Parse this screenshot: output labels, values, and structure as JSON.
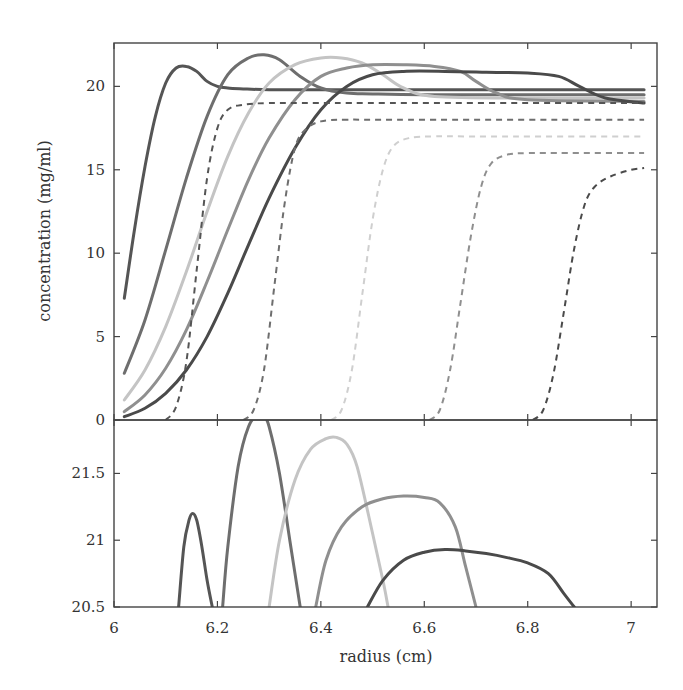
{
  "chart_data": [
    {
      "panel": "top",
      "type": "line",
      "title": "",
      "xlabel": "",
      "ylabel": "concentration (mg/ml)",
      "xlim": [
        6.0,
        7.05
      ],
      "ylim": [
        0,
        22.6
      ],
      "xticks": [
        6,
        6.2,
        6.4,
        6.6,
        6.8,
        7
      ],
      "xtick_labels": [],
      "yticks": [
        0,
        5,
        10,
        15,
        20
      ],
      "ytick_labels": [
        "0",
        "5",
        "10",
        "15",
        "20"
      ],
      "grid": false,
      "legend": null,
      "series": [
        {
          "name": "solid-1",
          "style": "solid",
          "color": "#555555",
          "x": [
            6.02,
            6.04,
            6.06,
            6.08,
            6.1,
            6.12,
            6.14,
            6.16,
            6.18,
            6.2,
            6.22,
            6.25,
            6.3,
            6.4,
            6.6,
            6.8,
            7.025
          ],
          "y": [
            7.3,
            11.5,
            15.2,
            18.2,
            20.2,
            21.1,
            21.2,
            20.9,
            20.3,
            20.0,
            19.9,
            19.85,
            19.8,
            19.8,
            19.8,
            19.8,
            19.8
          ]
        },
        {
          "name": "solid-2",
          "style": "solid",
          "color": "#6e6e6e",
          "x": [
            6.02,
            6.06,
            6.1,
            6.14,
            6.18,
            6.22,
            6.26,
            6.29,
            6.32,
            6.36,
            6.4,
            6.45,
            6.5,
            6.6,
            6.8,
            7.025
          ],
          "y": [
            2.8,
            6.0,
            10.2,
            14.5,
            18.2,
            20.7,
            21.7,
            21.9,
            21.6,
            20.6,
            19.9,
            19.6,
            19.55,
            19.5,
            19.5,
            19.5
          ]
        },
        {
          "name": "solid-3",
          "style": "solid",
          "color": "#c4c4c4",
          "x": [
            6.02,
            6.06,
            6.1,
            6.14,
            6.18,
            6.22,
            6.26,
            6.3,
            6.35,
            6.4,
            6.44,
            6.48,
            6.52,
            6.56,
            6.62,
            6.8,
            7.025
          ],
          "y": [
            1.2,
            3.0,
            5.6,
            8.9,
            12.5,
            15.8,
            18.4,
            20.2,
            21.3,
            21.7,
            21.7,
            21.4,
            20.7,
            19.9,
            19.4,
            19.3,
            19.3
          ]
        },
        {
          "name": "solid-4",
          "style": "solid",
          "color": "#8f8f8f",
          "x": [
            6.02,
            6.06,
            6.1,
            6.14,
            6.18,
            6.22,
            6.26,
            6.3,
            6.35,
            6.4,
            6.45,
            6.5,
            6.56,
            6.62,
            6.67,
            6.7,
            6.74,
            6.8,
            7.025
          ],
          "y": [
            0.5,
            1.5,
            3.1,
            5.4,
            8.3,
            11.4,
            14.4,
            16.9,
            19.2,
            20.6,
            21.1,
            21.3,
            21.3,
            21.2,
            20.9,
            20.3,
            19.6,
            19.2,
            19.1
          ]
        },
        {
          "name": "solid-5",
          "style": "solid",
          "color": "#4a4a4a",
          "x": [
            6.02,
            6.06,
            6.1,
            6.14,
            6.18,
            6.22,
            6.26,
            6.3,
            6.35,
            6.4,
            6.45,
            6.5,
            6.56,
            6.64,
            6.72,
            6.8,
            6.86,
            6.9,
            6.95,
            7.025
          ],
          "y": [
            0.2,
            0.7,
            1.6,
            3.0,
            5.0,
            7.6,
            10.5,
            13.3,
            16.3,
            18.6,
            20.0,
            20.7,
            20.9,
            20.9,
            20.85,
            20.8,
            20.6,
            20.0,
            19.3,
            19.0
          ]
        },
        {
          "name": "dashed-1",
          "style": "dashed",
          "color": "#555555",
          "x": [
            6.1,
            6.12,
            6.14,
            6.16,
            6.18,
            6.2,
            6.22,
            6.25,
            6.3,
            6.4,
            7.025
          ],
          "y": [
            0.0,
            0.8,
            3.5,
            9.0,
            14.5,
            17.5,
            18.6,
            18.9,
            19.0,
            19.0,
            19.0
          ]
        },
        {
          "name": "dashed-2",
          "style": "dashed",
          "color": "#6e6e6e",
          "x": [
            6.25,
            6.27,
            6.29,
            6.31,
            6.33,
            6.35,
            6.37,
            6.4,
            6.45,
            6.55,
            7.025
          ],
          "y": [
            0.0,
            0.6,
            3.0,
            8.0,
            13.0,
            16.3,
            17.4,
            17.9,
            18.0,
            18.0,
            18.0
          ]
        },
        {
          "name": "dashed-3",
          "style": "dashed",
          "color": "#cfcfcf",
          "x": [
            6.42,
            6.44,
            6.46,
            6.48,
            6.5,
            6.52,
            6.54,
            6.57,
            6.62,
            6.7,
            7.025
          ],
          "y": [
            0.0,
            0.6,
            3.0,
            7.5,
            12.0,
            15.0,
            16.4,
            16.9,
            17.0,
            17.0,
            17.0
          ]
        },
        {
          "name": "dashed-4",
          "style": "dashed",
          "color": "#8f8f8f",
          "x": [
            6.61,
            6.63,
            6.65,
            6.67,
            6.69,
            6.71,
            6.73,
            6.76,
            6.8,
            6.88,
            7.025
          ],
          "y": [
            0.0,
            0.6,
            3.0,
            7.0,
            11.0,
            14.0,
            15.4,
            15.9,
            16.0,
            16.0,
            16.0
          ]
        },
        {
          "name": "dashed-5",
          "style": "dashed",
          "color": "#4a4a4a",
          "x": [
            6.81,
            6.83,
            6.85,
            6.87,
            6.89,
            6.91,
            6.93,
            6.96,
            7.0,
            7.025
          ],
          "y": [
            0.0,
            0.6,
            2.8,
            6.5,
            10.3,
            12.9,
            14.0,
            14.6,
            15.0,
            15.1
          ]
        }
      ]
    },
    {
      "panel": "bottom",
      "type": "line",
      "title": "",
      "xlabel": "radius (cm)",
      "ylabel": "",
      "xlim": [
        6.0,
        7.05
      ],
      "ylim": [
        20.5,
        21.9
      ],
      "xticks": [
        6,
        6.2,
        6.4,
        6.6,
        6.8,
        7
      ],
      "xtick_labels": [
        "6",
        "6.2",
        "6.4",
        "6.6",
        "6.8",
        "7"
      ],
      "yticks": [
        20.5,
        21,
        21.5
      ],
      "ytick_labels": [
        "20.5",
        "21",
        "21.5"
      ],
      "grid": false,
      "legend": null,
      "series": [
        {
          "name": "peak-1",
          "color": "#555555",
          "x": [
            6.125,
            6.135,
            6.145,
            6.152,
            6.16,
            6.17,
            6.18,
            6.19
          ],
          "y": [
            20.5,
            20.95,
            21.15,
            21.2,
            21.15,
            20.95,
            20.7,
            20.5
          ]
        },
        {
          "name": "peak-2",
          "color": "#6e6e6e",
          "x": [
            6.21,
            6.22,
            6.24,
            6.26,
            6.28,
            6.29,
            6.3,
            6.32,
            6.34,
            6.36
          ],
          "y": [
            20.5,
            20.95,
            21.55,
            21.85,
            21.95,
            21.93,
            21.85,
            21.5,
            21.0,
            20.5
          ]
        },
        {
          "name": "peak-3",
          "color": "#c4c4c4",
          "x": [
            6.3,
            6.32,
            6.35,
            6.38,
            6.41,
            6.43,
            6.45,
            6.47,
            6.5,
            6.52,
            6.53
          ],
          "y": [
            20.5,
            21.0,
            21.45,
            21.68,
            21.76,
            21.77,
            21.72,
            21.55,
            21.05,
            20.7,
            20.5
          ]
        },
        {
          "name": "peak-4",
          "color": "#8f8f8f",
          "x": [
            6.39,
            6.41,
            6.44,
            6.48,
            6.52,
            6.56,
            6.6,
            6.63,
            6.66,
            6.68,
            6.7
          ],
          "y": [
            20.5,
            20.85,
            21.1,
            21.25,
            21.31,
            21.33,
            21.32,
            21.28,
            21.1,
            20.8,
            20.5
          ]
        },
        {
          "name": "peak-5",
          "color": "#4a4a4a",
          "x": [
            6.49,
            6.52,
            6.56,
            6.6,
            6.64,
            6.68,
            6.72,
            6.76,
            6.8,
            6.84,
            6.87,
            6.89
          ],
          "y": [
            20.5,
            20.7,
            20.85,
            20.91,
            20.93,
            20.92,
            20.9,
            20.87,
            20.83,
            20.75,
            20.6,
            20.5
          ]
        }
      ]
    }
  ],
  "labels": {
    "ylabel": "concentration (mg/ml)",
    "xlabel": "radius (cm)"
  }
}
